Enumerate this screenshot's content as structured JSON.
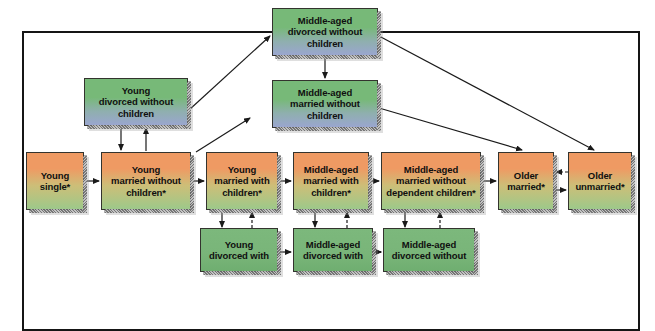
{
  "diagram": {
    "type": "flow-diagram",
    "frame": {
      "border_color": "#151515"
    },
    "colors": {
      "orange_gradient_top": "#ef9a63",
      "orange_gradient_bottom": "#9dc98a",
      "blue_gradient_top": "#77b978",
      "blue_gradient_bottom": "#9aa6cf",
      "green_solid": "#7cb87c",
      "arrow_color": "#1a1a1a"
    },
    "nodes": [
      {
        "id": "middle-aged-divorced-without-children",
        "label": "Middle-aged\ndivorced without\nchildren",
        "style": "blue",
        "x": 272,
        "y": 8,
        "w": 106,
        "h": 48
      },
      {
        "id": "young-divorced-without-children",
        "label": "Young\ndivorced without\nchildren",
        "style": "blue",
        "x": 84,
        "y": 78,
        "w": 104,
        "h": 48
      },
      {
        "id": "middle-aged-married-without-children",
        "label": "Middle-aged\nmarried without\nchildren",
        "style": "blue",
        "x": 272,
        "y": 80,
        "w": 106,
        "h": 48
      },
      {
        "id": "young-single",
        "label": "Young\nsingle*",
        "style": "orange",
        "x": 26,
        "y": 152,
        "w": 58,
        "h": 58
      },
      {
        "id": "young-married-without-children",
        "label": "Young\nmarried without\nchildren*",
        "style": "orange",
        "x": 101,
        "y": 152,
        "w": 90,
        "h": 58
      },
      {
        "id": "young-married-with-children",
        "label": "Young\nmarried with\nchildren*",
        "style": "orange",
        "x": 206,
        "y": 152,
        "w": 72,
        "h": 58
      },
      {
        "id": "middle-aged-married-with-children",
        "label": "Middle-aged\nmarried with\nchildren*",
        "style": "orange",
        "x": 293,
        "y": 152,
        "w": 76,
        "h": 58
      },
      {
        "id": "middle-aged-married-without-dependent-children",
        "label": "Middle-aged\nmarried without\ndependent children*",
        "style": "orange",
        "x": 381,
        "y": 152,
        "w": 100,
        "h": 58
      },
      {
        "id": "older-married",
        "label": "Older\nmarried*",
        "style": "orange",
        "x": 498,
        "y": 152,
        "w": 56,
        "h": 58
      },
      {
        "id": "older-unmarried",
        "label": "Older\nunmarried*",
        "style": "orange",
        "x": 568,
        "y": 152,
        "w": 64,
        "h": 58
      },
      {
        "id": "young-divorced-with-children",
        "label": "Young\ndivorced with",
        "style": "green",
        "x": 200,
        "y": 228,
        "w": 78,
        "h": 44
      },
      {
        "id": "middle-aged-divorced-with-children",
        "label": "Middle-aged\ndivorced with",
        "style": "green",
        "x": 293,
        "y": 228,
        "w": 80,
        "h": 44
      },
      {
        "id": "middle-aged-divorced-without-children-bottom",
        "label": "Middle-aged\ndivorced without",
        "style": "green",
        "x": 383,
        "y": 228,
        "w": 92,
        "h": 44
      }
    ],
    "connections": [
      {
        "from": "young-single",
        "to": "young-married-without-children",
        "style": "solid"
      },
      {
        "from": "young-married-without-children",
        "to": "young-married-with-children",
        "style": "solid"
      },
      {
        "from": "young-married-with-children",
        "to": "middle-aged-married-with-children",
        "style": "solid"
      },
      {
        "from": "middle-aged-married-with-children",
        "to": "middle-aged-married-without-dependent-children",
        "style": "solid"
      },
      {
        "from": "middle-aged-married-without-dependent-children",
        "to": "older-married",
        "style": "solid"
      },
      {
        "from": "older-married",
        "to": "older-unmarried",
        "style": "solid"
      },
      {
        "from": "older-unmarried",
        "to": "older-married",
        "style": "dashed"
      },
      {
        "from": "young-married-without-children",
        "to": "young-divorced-without-children",
        "style": "solid"
      },
      {
        "from": "young-divorced-without-children",
        "to": "young-married-without-children",
        "style": "solid"
      },
      {
        "from": "young-divorced-without-children",
        "to": "middle-aged-divorced-without-children",
        "style": "solid"
      },
      {
        "from": "middle-aged-divorced-without-children",
        "to": "middle-aged-married-without-children",
        "style": "solid"
      },
      {
        "from": "middle-aged-divorced-without-children",
        "to": "older-unmarried",
        "style": "solid"
      },
      {
        "from": "middle-aged-married-without-children",
        "to": "older-married",
        "style": "solid"
      },
      {
        "from": "young-married-with-children",
        "to": "young-divorced-with-children",
        "style": "solid"
      },
      {
        "from": "young-divorced-with-children",
        "to": "young-married-with-children",
        "style": "dashed"
      },
      {
        "from": "middle-aged-married-with-children",
        "to": "middle-aged-divorced-with-children",
        "style": "solid"
      },
      {
        "from": "middle-aged-divorced-with-children",
        "to": "middle-aged-married-with-children",
        "style": "dashed"
      },
      {
        "from": "middle-aged-married-without-dependent-children",
        "to": "middle-aged-divorced-without-children-bottom",
        "style": "solid"
      },
      {
        "from": "middle-aged-divorced-without-children-bottom",
        "to": "middle-aged-married-without-dependent-children",
        "style": "dashed"
      },
      {
        "from": "young-divorced-with-children",
        "to": "middle-aged-divorced-with-children",
        "style": "solid"
      },
      {
        "from": "middle-aged-divorced-with-children",
        "to": "middle-aged-divorced-without-children-bottom",
        "style": "solid"
      }
    ]
  }
}
